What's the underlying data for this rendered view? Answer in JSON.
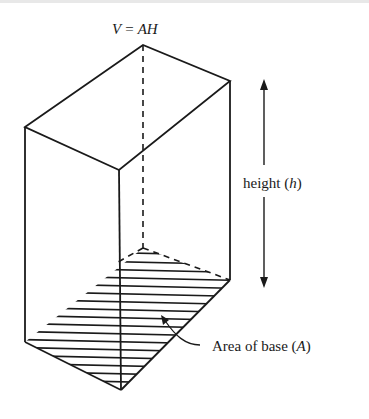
{
  "diagram": {
    "type": "rectangular-prism-volume",
    "formula": {
      "lhs": "V",
      "eq": "=",
      "rhs": "AH"
    },
    "height_label": {
      "text": "height ",
      "var": "h"
    },
    "base_label": {
      "text": "Area of base ",
      "var": "A"
    },
    "colors": {
      "ink": "#1a1a1a",
      "background": "#ffffff"
    }
  }
}
